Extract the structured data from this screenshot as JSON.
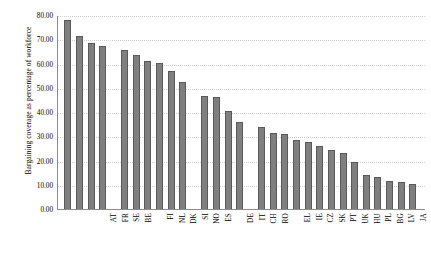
{
  "chart_data": {
    "type": "bar",
    "title": "",
    "xlabel": "",
    "ylabel": "Bargaining coverage as percentage of workforce",
    "ylim": [
      0,
      80
    ],
    "ytick_step": 10,
    "ytick_labels": [
      "0.00",
      "10.00",
      "20.00",
      "30.00",
      "40.00",
      "50.00",
      "60.00",
      "70.00",
      "80.00"
    ],
    "grid": true,
    "legend": "none",
    "bar_color": "#7f7f7f",
    "bar_edge_color": "#595959",
    "categories": [
      "AT",
      "FR",
      "SE",
      "BE",
      "FI",
      "NL",
      "DK",
      "SI",
      "NO",
      "ES",
      "DE",
      "IT",
      "CH",
      "RO",
      "EL",
      "IE",
      "CZ",
      "SK",
      "PT",
      "UK",
      "HU",
      "PL",
      "BG",
      "LV",
      "JA",
      "US",
      "EE",
      "LT"
    ],
    "values": [
      78.0,
      71.3,
      68.4,
      67.4,
      65.5,
      63.5,
      61.0,
      60.2,
      57.0,
      52.2,
      46.7,
      46.3,
      40.5,
      36.0,
      34.0,
      31.5,
      30.8,
      28.6,
      27.6,
      26.0,
      24.2,
      23.0,
      19.2,
      14.0,
      13.0,
      11.6,
      11.2,
      10.2
    ],
    "group_breaks_after": [
      "BE",
      "ES",
      "RO"
    ]
  }
}
